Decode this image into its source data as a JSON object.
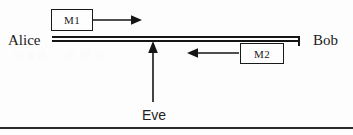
{
  "diagram": {
    "type": "network-attack-diagram",
    "background_color": "#fdfdfd",
    "line_color": "#151515",
    "endpoints": [
      {
        "id": "alice",
        "label": "Alice",
        "side": "left"
      },
      {
        "id": "bob",
        "label": "Bob",
        "side": "right"
      }
    ],
    "attacker": {
      "id": "eve",
      "label": "Eve",
      "position": "below-channel"
    },
    "channel": {
      "label": "",
      "style": "double-rule",
      "from": "alice",
      "to": "bob"
    },
    "messages": [
      {
        "id": "m1",
        "label": "M1",
        "direction": "right",
        "arrow_name": "arrow-m1",
        "from": "alice",
        "to": "bob"
      },
      {
        "id": "m2",
        "label": "M2",
        "direction": "left",
        "arrow_name": "arrow-m2",
        "from": "bob",
        "to": "alice"
      }
    ],
    "intercept_arrow": {
      "id": "eve-intercept",
      "direction": "up",
      "from": "eve",
      "to": "channel"
    }
  }
}
